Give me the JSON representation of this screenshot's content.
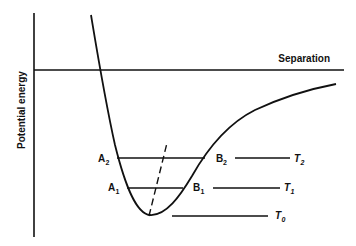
{
  "diagram": {
    "axes": {
      "y_label": "Potential energy",
      "x_label": "Separation"
    },
    "points": {
      "A2": {
        "letter": "A",
        "sub": "2"
      },
      "B2": {
        "letter": "B",
        "sub": "2"
      },
      "A1": {
        "letter": "A",
        "sub": "1"
      },
      "B1": {
        "letter": "B",
        "sub": "1"
      }
    },
    "levels": [
      {
        "id": "T2",
        "letter": "T",
        "sub": "2"
      },
      {
        "id": "T1",
        "letter": "T",
        "sub": "1"
      },
      {
        "id": "T0",
        "letter": "T",
        "sub": "0"
      }
    ],
    "colors": {
      "line": "#111111",
      "background": "#ffffff"
    }
  }
}
